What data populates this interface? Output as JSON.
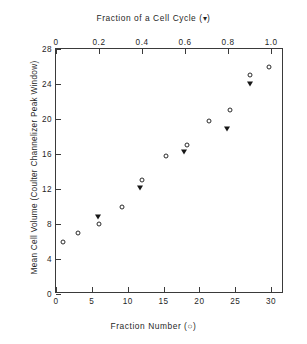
{
  "chart_data": {
    "type": "scatter",
    "title": "",
    "top_axis": {
      "label": "Fraction of a Cell Cycle   (▾)",
      "marker": "filled-triangle",
      "ticks": [
        "0",
        "0.2",
        "0.4",
        "0.6",
        "0.8",
        "1.0"
      ],
      "tick_values": [
        0,
        0.2,
        0.4,
        0.6,
        0.8,
        1.0
      ],
      "lim": [
        0,
        1.06
      ]
    },
    "bottom_axis": {
      "label": "Fraction Number (○)",
      "marker": "open-circle",
      "ticks": [
        "0",
        "5",
        "10",
        "15",
        "20",
        "25",
        "30"
      ],
      "tick_values": [
        0,
        5,
        10,
        15,
        20,
        25,
        30
      ],
      "lim": [
        0,
        31.8
      ]
    },
    "ylabel": "Mean Cell Volume (Coulter Channelizer Peak Window)",
    "y_ticks": [
      "0",
      "4",
      "8",
      "12",
      "16",
      "20",
      "24",
      "28"
    ],
    "y_tick_values": [
      0,
      4,
      8,
      12,
      16,
      20,
      24,
      28
    ],
    "ylim": [
      0,
      28
    ],
    "grid": false,
    "legend_position": "axis-titles",
    "series": [
      {
        "name": "Fraction Number (○)",
        "marker": "open-circle",
        "axis": "bottom",
        "color": "#2a2a2a",
        "x": [
          1.0,
          3.0,
          6.0,
          9.2,
          12.0,
          15.3,
          18.3,
          21.3,
          24.2,
          27.0,
          29.7
        ],
        "y": [
          6.0,
          7.0,
          8.0,
          10.0,
          13.0,
          15.8,
          17.0,
          19.8,
          21.0,
          25.0,
          26.0
        ]
      },
      {
        "name": "Fraction of a Cell Cycle (▾)",
        "marker": "filled-triangle",
        "axis": "top",
        "color": "#161616",
        "x": [
          0.195,
          0.39,
          0.595,
          0.795,
          0.9
        ],
        "y": [
          8.8,
          12.1,
          16.2,
          18.9,
          24.0
        ]
      }
    ]
  }
}
